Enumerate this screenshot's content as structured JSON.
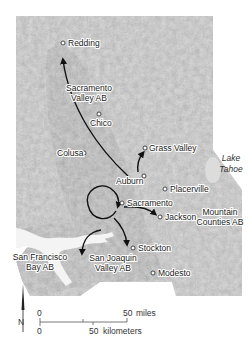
{
  "map": {
    "title": "",
    "colors": {
      "valley": "#9d9d9d",
      "mountains": "#b8b8b8",
      "water": "#f2f2f2",
      "arrow": "#111111",
      "background": "#ffffff"
    },
    "cities": [
      {
        "name": "Redding",
        "x": 63,
        "y": 43
      },
      {
        "name": "Chico",
        "x": 99,
        "y": 114
      },
      {
        "name": "Colusa",
        "x": 84,
        "y": 153
      },
      {
        "name": "Grass Valley",
        "x": 145,
        "y": 148
      },
      {
        "name": "Auburn",
        "x": 144,
        "y": 176
      },
      {
        "name": "Placerville",
        "x": 165,
        "y": 189
      },
      {
        "name": "Sacramento",
        "x": 122,
        "y": 203
      },
      {
        "name": "Jackson",
        "x": 160,
        "y": 217
      },
      {
        "name": "Stockton",
        "x": 133,
        "y": 248
      },
      {
        "name": "Modesto",
        "x": 153,
        "y": 273
      }
    ],
    "air_basins": [
      {
        "line1": "Sacramento",
        "line2": "Valley AB"
      },
      {
        "line1": "Mountain",
        "line2": "Counties AB"
      },
      {
        "line1": "San Francisco",
        "line2": "Bay AB"
      },
      {
        "line1": "San Joaquin",
        "line2": "Valley AB"
      }
    ],
    "lake": {
      "line1": "Lake",
      "line2": "Tahoe"
    },
    "scale_bar": {
      "miles_zero": "0",
      "miles_value": "50",
      "miles_unit": "miles",
      "km_zero": "0",
      "km_value": "50",
      "km_unit": "kilometers"
    },
    "north_label": "N"
  }
}
